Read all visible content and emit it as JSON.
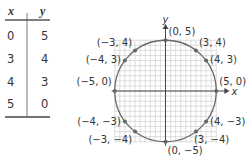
{
  "table": {
    "headers": [
      "x",
      "y"
    ],
    "rows": [
      [
        "0",
        "5"
      ],
      [
        "3",
        "4"
      ],
      [
        "4",
        "3"
      ],
      [
        "5",
        "0"
      ]
    ]
  },
  "chart_data": {
    "type": "scatter",
    "title": "",
    "xlabel": "x",
    "ylabel": "y",
    "xlim": [
      -5,
      5
    ],
    "ylim": [
      -5,
      5
    ],
    "grid": true,
    "curve": "circle x^2 + y^2 = 25",
    "radius": 5,
    "points": [
      {
        "x": 0,
        "y": 5,
        "label": "(0, 5)"
      },
      {
        "x": 3,
        "y": 4,
        "label": "(3, 4)"
      },
      {
        "x": 4,
        "y": 3,
        "label": "(4, 3)"
      },
      {
        "x": 5,
        "y": 0,
        "label": "(5, 0)"
      },
      {
        "x": 4,
        "y": -3,
        "label": "(4, −3)"
      },
      {
        "x": 3,
        "y": -4,
        "label": "(3, −4)"
      },
      {
        "x": 0,
        "y": -5,
        "label": "(0, −5)"
      },
      {
        "x": -3,
        "y": -4,
        "label": "(−3, −4)"
      },
      {
        "x": -4,
        "y": -3,
        "label": "(−4, −3)"
      },
      {
        "x": -5,
        "y": 0,
        "label": "(−5, 0)"
      },
      {
        "x": -4,
        "y": 3,
        "label": "(−4, 3)"
      },
      {
        "x": -3,
        "y": 4,
        "label": "(−3, 4)"
      }
    ],
    "colors": {
      "curve": "#666666",
      "grid": "#c8c8c8",
      "axis": "#444444",
      "point": "#666666",
      "text": "#333333"
    }
  }
}
